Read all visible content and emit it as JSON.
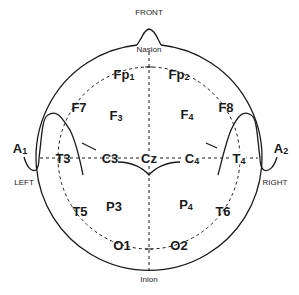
{
  "diagram": {
    "orientation_labels": {
      "front": "FRONT",
      "left": "LEFT",
      "right": "RIGHT",
      "nasion": "Nasion",
      "inion": "Inion"
    },
    "electrodes": [
      {
        "id": "Fp1",
        "base": "Fp",
        "sub": "1"
      },
      {
        "id": "Fp2",
        "base": "Fp",
        "sub": "2"
      },
      {
        "id": "F7",
        "base": "F",
        "sub": "7"
      },
      {
        "id": "F3",
        "base": "F",
        "sub": "3"
      },
      {
        "id": "F4",
        "base": "F",
        "sub": "4"
      },
      {
        "id": "F8",
        "base": "F",
        "sub": "8"
      },
      {
        "id": "A1",
        "base": "A",
        "sub": "1"
      },
      {
        "id": "T3",
        "base": "T",
        "sub": "3"
      },
      {
        "id": "C3",
        "base": "C",
        "sub": "3"
      },
      {
        "id": "Cz",
        "base": "C",
        "sub": "z"
      },
      {
        "id": "C4",
        "base": "C",
        "sub": "4"
      },
      {
        "id": "T4",
        "base": "T",
        "sub": "4"
      },
      {
        "id": "A2",
        "base": "A",
        "sub": "2"
      },
      {
        "id": "T5",
        "base": "T",
        "sub": "5"
      },
      {
        "id": "P3",
        "base": "P",
        "sub": "3"
      },
      {
        "id": "P4",
        "base": "P",
        "sub": "4"
      },
      {
        "id": "T6",
        "base": "T",
        "sub": "6"
      },
      {
        "id": "O1",
        "base": "O",
        "sub": "1"
      },
      {
        "id": "O2",
        "base": "O",
        "sub": "2"
      }
    ],
    "colors": {
      "line": "#1a1a1a",
      "background": "#ffffff"
    }
  }
}
